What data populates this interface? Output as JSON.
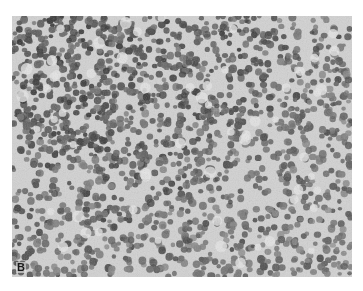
{
  "figure": {
    "type": "histology-micrograph",
    "panel_label": "B",
    "colors": {
      "background": "#cfcfcf",
      "nucleus_dark": "#4a4a4a",
      "nucleus_mid": "#7a7a7a",
      "stroma_light": "#e2e2e2"
    }
  }
}
